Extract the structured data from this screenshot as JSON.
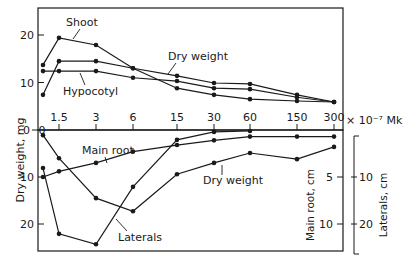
{
  "chart_data": [
    {
      "type": "line",
      "panel": "top",
      "title": "",
      "xlabel": "× 10⁻⁷ Mk",
      "ylabel": "Dry weight, mg",
      "x": [
        0,
        1.5,
        3,
        6,
        15,
        30,
        60,
        150,
        300
      ],
      "x_tick_labels": [
        "0",
        "1.5",
        "3",
        "6",
        "15",
        "30",
        "60",
        "150",
        "300"
      ],
      "x_scale": "categorical-log-like",
      "ylim": [
        0,
        25
      ],
      "y_ticks": [
        0,
        10,
        20
      ],
      "grid": false,
      "series": [
        {
          "name": "Shoot",
          "values": [
            13.7,
            19.4,
            17.9,
            13.0,
            8.8,
            7.4,
            6.5,
            6.1,
            5.9
          ]
        },
        {
          "name": "Dry weight",
          "values": [
            7.4,
            14.5,
            14.5,
            13.0,
            11.4,
            9.9,
            9.7,
            7.4,
            5.9
          ]
        },
        {
          "name": "Hypocotyl",
          "values": [
            12.4,
            12.4,
            12.4,
            11.0,
            10.3,
            8.8,
            8.6,
            6.9,
            5.9
          ]
        }
      ],
      "annotations": [
        "Shoot",
        "Dry weight",
        "Hypocotyl"
      ]
    },
    {
      "type": "line",
      "panel": "bottom",
      "title": "",
      "xlabel": "× 10⁻⁷ Mk",
      "ylabel_left": "Dry weight, mg",
      "ylabel_right": [
        "Main root, cm",
        "Laterals, cm"
      ],
      "x": [
        0,
        1.5,
        3,
        6,
        15,
        30,
        60,
        150,
        300
      ],
      "y_inverted": true,
      "y_ticks_left": [
        0,
        10,
        20
      ],
      "y_ticks_main_root": [
        5,
        10
      ],
      "y_ticks_laterals": [
        10,
        20
      ],
      "grid": false,
      "series": [
        {
          "name": "Main root",
          "unit": "cm",
          "values": [
            5.0,
            4.4,
            3.5,
            2.3,
            1.6,
            1.1,
            0.7,
            0.7,
            0.7
          ]
        },
        {
          "name": "Laterals",
          "unit": "cm",
          "values": [
            8.1,
            22.1,
            24.3,
            12.1,
            2.1,
            0.4,
            0.2,
            null,
            null
          ]
        },
        {
          "name": "Dry weight",
          "unit": "mg",
          "values": [
            1.1,
            6.0,
            14.5,
            17.3,
            9.4,
            7.0,
            4.9,
            6.2,
            3.6
          ]
        }
      ],
      "annotations": [
        "Main root",
        "Dry weight",
        "Laterals"
      ]
    }
  ],
  "labels": {
    "y_axis_left": "Dry weight, mg",
    "y_axis_main_root": "Main root, cm",
    "y_axis_laterals": "Laterals, cm",
    "x_unit": "× 10⁻⁷ Mk",
    "x_ticks": [
      "0",
      "1.5",
      "3",
      "6",
      "15",
      "30",
      "60",
      "150",
      "300"
    ],
    "top_y_ticks": [
      "0",
      "10",
      "20"
    ],
    "bottom_y_ticks": [
      "10",
      "20"
    ],
    "main_root_ticks": [
      "5",
      "10"
    ],
    "laterals_ticks": [
      "10",
      "20"
    ],
    "bottom_zero": "0",
    "ann_shoot": "Shoot",
    "ann_dry_weight_top": "Dry weight",
    "ann_hypocotyl": "Hypocotyl",
    "ann_main_root": "Main root",
    "ann_dry_weight_bottom": "Dry weight",
    "ann_laterals": "Laterals"
  },
  "style": {
    "line_color": "#1a1a1a",
    "background": "#ffffff"
  }
}
